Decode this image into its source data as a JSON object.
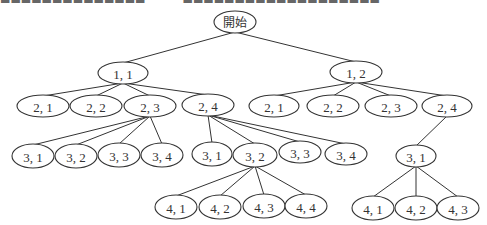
{
  "header_fragment": {
    "text_left": "▬▬▬▬▬▬▬▬▬▬▬▬▬▬",
    "text_right": "▬▬▬▬▬▬▬▬▬▬▬▬▬▬▬▬▬▬▬"
  },
  "tree": {
    "nodes": [
      {
        "id": "root",
        "label": "開始",
        "cx": 235,
        "cy": 22,
        "rx": 21,
        "ry": 11
      },
      {
        "id": "L1_1",
        "label": "1, 1",
        "cx": 123,
        "cy": 73,
        "rx": 25,
        "ry": 11
      },
      {
        "id": "L1_2",
        "label": "1, 2",
        "cx": 356,
        "cy": 72,
        "rx": 26,
        "ry": 11
      },
      {
        "id": "A2_1",
        "label": "2, 1",
        "cx": 43,
        "cy": 106,
        "rx": 26,
        "ry": 11
      },
      {
        "id": "A2_2",
        "label": "2, 2",
        "cx": 96,
        "cy": 106,
        "rx": 26,
        "ry": 11
      },
      {
        "id": "A2_3",
        "label": "2, 3",
        "cx": 150,
        "cy": 106,
        "rx": 26,
        "ry": 11
      },
      {
        "id": "A2_4",
        "label": "2, 4",
        "cx": 208,
        "cy": 105,
        "rx": 26,
        "ry": 11
      },
      {
        "id": "B2_1",
        "label": "2, 1",
        "cx": 274,
        "cy": 106,
        "rx": 25,
        "ry": 11
      },
      {
        "id": "B2_2",
        "label": "2, 2",
        "cx": 333,
        "cy": 106,
        "rx": 26,
        "ry": 11
      },
      {
        "id": "B2_3",
        "label": "2, 3",
        "cx": 391,
        "cy": 106,
        "rx": 26,
        "ry": 11
      },
      {
        "id": "B2_4",
        "label": "2, 4",
        "cx": 447,
        "cy": 106,
        "rx": 25,
        "ry": 11
      },
      {
        "id": "A3_1",
        "label": "3, 1",
        "cx": 33,
        "cy": 156,
        "rx": 21,
        "ry": 12
      },
      {
        "id": "A3_2",
        "label": "3, 2",
        "cx": 76,
        "cy": 156,
        "rx": 21,
        "ry": 12
      },
      {
        "id": "A3_3",
        "label": "3, 3",
        "cx": 119,
        "cy": 155,
        "rx": 21,
        "ry": 12
      },
      {
        "id": "A3_4",
        "label": "3, 4",
        "cx": 162,
        "cy": 155,
        "rx": 21,
        "ry": 12
      },
      {
        "id": "M3_1",
        "label": "3, 1",
        "cx": 212,
        "cy": 154,
        "rx": 20,
        "ry": 12
      },
      {
        "id": "M3_2",
        "label": "3, 2",
        "cx": 255,
        "cy": 155,
        "rx": 22,
        "ry": 12
      },
      {
        "id": "M3_3",
        "label": "3, 3",
        "cx": 300,
        "cy": 152,
        "rx": 21,
        "ry": 11
      },
      {
        "id": "M3_4",
        "label": "3, 4",
        "cx": 346,
        "cy": 154,
        "rx": 21,
        "ry": 11
      },
      {
        "id": "R3_1",
        "label": "3, 1",
        "cx": 416,
        "cy": 156,
        "rx": 20,
        "ry": 11
      },
      {
        "id": "M4_1",
        "label": "4, 1",
        "cx": 176,
        "cy": 207,
        "rx": 21,
        "ry": 12
      },
      {
        "id": "M4_2",
        "label": "4, 2",
        "cx": 220,
        "cy": 207,
        "rx": 21,
        "ry": 12
      },
      {
        "id": "M4_3",
        "label": "4, 3",
        "cx": 264,
        "cy": 206,
        "rx": 21,
        "ry": 12
      },
      {
        "id": "M4_4",
        "label": "4, 4",
        "cx": 306,
        "cy": 206,
        "rx": 21,
        "ry": 12
      },
      {
        "id": "R4_1",
        "label": "4, 1",
        "cx": 373,
        "cy": 208,
        "rx": 21,
        "ry": 12
      },
      {
        "id": "R4_2",
        "label": "4, 2",
        "cx": 416,
        "cy": 208,
        "rx": 21,
        "ry": 12
      },
      {
        "id": "R4_3",
        "label": "4, 3",
        "cx": 458,
        "cy": 208,
        "rx": 21,
        "ry": 12
      }
    ],
    "edges": [
      [
        "root",
        "L1_1"
      ],
      [
        "root",
        "L1_2"
      ],
      [
        "L1_1",
        "A2_1"
      ],
      [
        "L1_1",
        "A2_2"
      ],
      [
        "L1_1",
        "A2_3"
      ],
      [
        "L1_1",
        "A2_4"
      ],
      [
        "L1_2",
        "B2_1"
      ],
      [
        "L1_2",
        "B2_2"
      ],
      [
        "L1_2",
        "B2_3"
      ],
      [
        "L1_2",
        "B2_4"
      ],
      [
        "A2_3",
        "A3_1"
      ],
      [
        "A2_3",
        "A3_2"
      ],
      [
        "A2_3",
        "A3_3"
      ],
      [
        "A2_3",
        "A3_4"
      ],
      [
        "A2_4",
        "M3_1"
      ],
      [
        "A2_4",
        "M3_2"
      ],
      [
        "A2_4",
        "M3_3"
      ],
      [
        "A2_4",
        "M3_4"
      ],
      [
        "B2_4",
        "R3_1"
      ],
      [
        "M3_2",
        "M4_1"
      ],
      [
        "M3_2",
        "M4_2"
      ],
      [
        "M3_2",
        "M4_3"
      ],
      [
        "M3_2",
        "M4_4"
      ],
      [
        "R3_1",
        "R4_1"
      ],
      [
        "R3_1",
        "R4_2"
      ],
      [
        "R3_1",
        "R4_3"
      ]
    ]
  }
}
